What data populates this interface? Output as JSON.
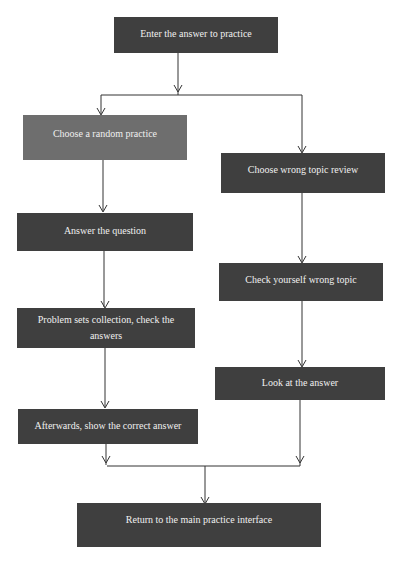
{
  "diagram": {
    "type": "flowchart",
    "colors": {
      "dark_box": "#3f3f3f",
      "mid_box": "#6e6e6e",
      "text": "#f0f0f0",
      "line": "#333333"
    },
    "nodes": {
      "start": "Enter the answer to practice",
      "random": "Choose a random practice",
      "answer_q": "Answer the question",
      "problem_sets": "Problem sets collection, check the answers",
      "afterwards": "Afterwards, show the correct answer",
      "wrong_review": "Choose wrong topic review",
      "check_wrong": "Check yourself wrong topic",
      "look_answer": "Look at the answer",
      "return_main": "Return to the main practice interface"
    }
  }
}
